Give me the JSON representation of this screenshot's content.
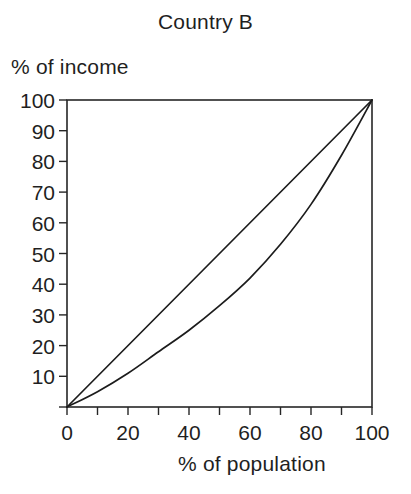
{
  "chart_data": {
    "type": "line",
    "title": "Country B",
    "xlabel": "% of population",
    "ylabel": "% of income",
    "xlim": [
      0,
      100
    ],
    "ylim": [
      0,
      100
    ],
    "grid": false,
    "legend": "none",
    "x_ticks": [
      0,
      20,
      40,
      60,
      80,
      100
    ],
    "x_tick_labels": [
      "0",
      "20",
      "40",
      "60",
      "80",
      "100"
    ],
    "x_minor_ticks": [
      0,
      10,
      20,
      30,
      40,
      50,
      60,
      70,
      80,
      90,
      100
    ],
    "y_ticks": [
      10,
      20,
      30,
      40,
      50,
      60,
      70,
      80,
      90,
      100
    ],
    "y_tick_labels": [
      "10",
      "20",
      "30",
      "40",
      "50",
      "60",
      "70",
      "80",
      "90",
      "100"
    ],
    "y_minor_ticks": [
      0,
      10,
      20,
      30,
      40,
      50,
      60,
      70,
      80,
      90,
      100
    ],
    "series": [
      {
        "name": "line of equality",
        "x": [
          0,
          100
        ],
        "values": [
          0,
          100
        ]
      },
      {
        "name": "Lorenz curve",
        "x": [
          0,
          10,
          20,
          30,
          40,
          50,
          60,
          70,
          80,
          90,
          100
        ],
        "values": [
          0,
          5,
          11,
          18,
          25,
          33,
          42,
          53,
          66,
          82,
          100
        ]
      }
    ],
    "colors": {
      "line": "#1c1c1c",
      "axis": "#262626",
      "background": "#ffffff",
      "text": "#1f1f1f"
    }
  }
}
